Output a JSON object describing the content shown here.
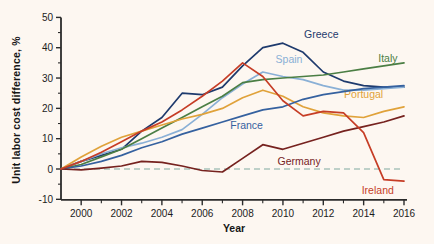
{
  "figure": {
    "background": "#fdf7f1",
    "axis_color": "#2b2b2b",
    "zero_line_color": "#a9c3ba",
    "text_color": "#161616"
  },
  "chart_data": {
    "type": "line",
    "title": "",
    "xlabel": "Year",
    "ylabel": "Unit labor cost difference, %",
    "xlim": [
      1999,
      2016
    ],
    "ylim": [
      -10,
      50
    ],
    "grid": false,
    "zero_baseline": {
      "y": 0,
      "style": "dashed"
    },
    "x": [
      1999,
      2000,
      2001,
      2002,
      2003,
      2004,
      2005,
      2006,
      2007,
      2008,
      2009,
      2010,
      2011,
      2012,
      2013,
      2014,
      2015,
      2016
    ],
    "x_major_ticks": [
      2000,
      2002,
      2004,
      2006,
      2008,
      2010,
      2012,
      2014,
      2016
    ],
    "x_major_tick_labels": [
      "2000",
      "2002",
      "2004",
      "2006",
      "2008",
      "2010",
      "2012",
      "2014",
      "2016"
    ],
    "x_minor_ticks": [
      2001,
      2003,
      2005,
      2007,
      2009,
      2011,
      2013,
      2015
    ],
    "y_major_ticks": [
      -10,
      0,
      10,
      20,
      30,
      40,
      50
    ],
    "y_major_tick_labels": [
      "-10",
      "0",
      "10",
      "20",
      "30",
      "40",
      "50"
    ],
    "y_minor_ticks": [
      -5,
      5,
      15,
      25,
      35,
      45
    ],
    "legend_position": "inline-labels",
    "series": [
      {
        "name": "Greece",
        "color": "#1e3a6d",
        "values": [
          0,
          2.5,
          4.5,
          6.5,
          12.5,
          17,
          25,
          24.5,
          27,
          34,
          40,
          41.5,
          38.5,
          32,
          29,
          27.5,
          27,
          27
        ],
        "label": {
          "x": 2011.9,
          "y": 44.5
        }
      },
      {
        "name": "Spain",
        "color": "#8ab0d6",
        "values": [
          0,
          2.5,
          5,
          7,
          8.5,
          10.5,
          13,
          18,
          23.5,
          28,
          32,
          30.5,
          29.5,
          27.5,
          26,
          26,
          26.5,
          27
        ],
        "label": {
          "x": 2010.3,
          "y": 36
        }
      },
      {
        "name": "Italy",
        "color": "#4b7e44",
        "values": [
          0,
          1.5,
          4,
          6.5,
          10,
          13.5,
          17,
          20.5,
          24,
          28.5,
          29.5,
          30,
          30.5,
          31,
          32,
          33,
          34,
          35
        ],
        "label": {
          "x": 2015.2,
          "y": 36.5
        }
      },
      {
        "name": "Portugal",
        "color": "#e0a23a",
        "values": [
          0,
          4,
          7.5,
          10.5,
          12.5,
          14.5,
          16.5,
          18,
          20,
          23.5,
          26,
          24,
          20.5,
          18.5,
          17.5,
          17,
          19,
          20.5
        ],
        "label": {
          "x": 2014.0,
          "y": 24.5
        }
      },
      {
        "name": "France",
        "color": "#35619f",
        "values": [
          0,
          1,
          2.5,
          4.5,
          7,
          9,
          11.5,
          13.5,
          15.5,
          17.5,
          19.5,
          20.5,
          23,
          24.5,
          25.5,
          26.5,
          27,
          27.5
        ],
        "label": {
          "x": 2008.2,
          "y": 14.5
        }
      },
      {
        "name": "Germany",
        "color": "#76221f",
        "values": [
          0,
          -0.3,
          0.3,
          1,
          2.5,
          2.2,
          1,
          -0.5,
          -1,
          3.5,
          8,
          6.5,
          8.5,
          10.5,
          12.5,
          14,
          15.5,
          17.5
        ],
        "label": {
          "x": 2010.8,
          "y": 2.5
        }
      },
      {
        "name": "Ireland",
        "color": "#c63d26",
        "values": [
          0,
          2.5,
          5.5,
          9,
          12.5,
          15.5,
          19.5,
          24,
          29,
          35,
          30.5,
          22.5,
          17.5,
          19,
          18.5,
          12,
          -3.5,
          -4
        ],
        "label": {
          "x": 2014.7,
          "y": -7
        }
      }
    ]
  }
}
